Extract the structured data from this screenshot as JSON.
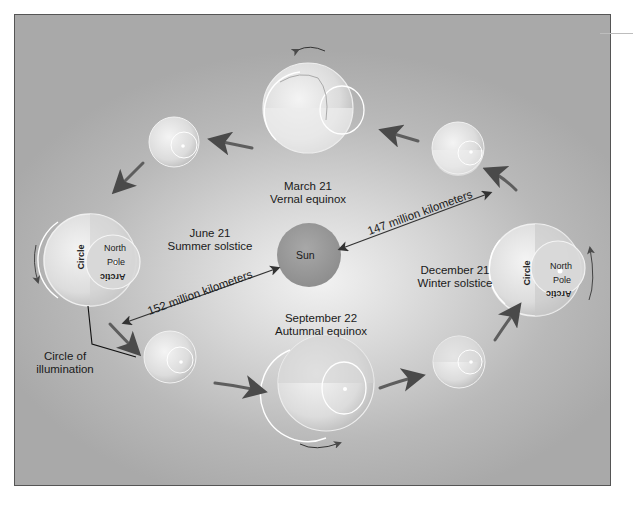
{
  "diagram": {
    "sun": {
      "label": "Sun",
      "color": "#9e9e9e"
    },
    "positions": [
      {
        "id": "march",
        "date": "March 21",
        "event": "Vernal equinox"
      },
      {
        "id": "june",
        "date": "June 21",
        "event": "Summer solstice"
      },
      {
        "id": "september",
        "date": "September 22",
        "event": "Autumnal equinox"
      },
      {
        "id": "december",
        "date": "December 21",
        "event": "Winter solstice"
      }
    ],
    "distances": {
      "perihelion": "147 million kilometers",
      "aphelion": "152 million kilometers"
    },
    "globe_labels": {
      "north": "North",
      "pole": "Pole",
      "circle": "Circle",
      "arctic": "Arctic"
    },
    "annotation": {
      "line1": "Circle of",
      "line2": "illumination"
    },
    "colors": {
      "background_center": "#f2f2f2",
      "background_edge": "#a9a9a9",
      "arrow": "#5a5a5a",
      "border": "#555555"
    }
  }
}
